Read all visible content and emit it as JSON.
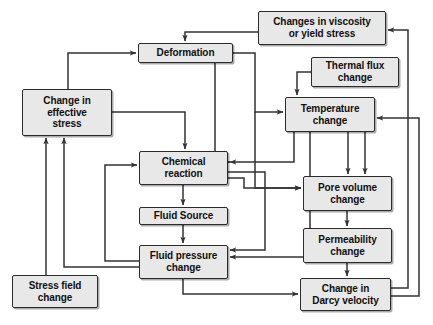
{
  "diagram": {
    "background_color": "#ffffff",
    "node_fill_color": "#e8e8e8",
    "node_border_color": "#2b2b2b",
    "arrow_color": "#333333",
    "nodes": [
      {
        "id": "viscosity",
        "label": "Changes in viscosity or yield stress",
        "line1": "Changes in viscosity",
        "line2": "or yield stress",
        "x": 258,
        "y": 11,
        "w": 128,
        "h": 34
      },
      {
        "id": "deformation",
        "label": "Deformation",
        "line1": "Deformation",
        "line2": "",
        "x": 138,
        "y": 43,
        "w": 95,
        "h": 20
      },
      {
        "id": "thermal-flux",
        "label": "Thermal flux change",
        "line1": "Thermal flux",
        "line2": "change",
        "x": 311,
        "y": 57,
        "w": 88,
        "h": 30
      },
      {
        "id": "effective-stress",
        "label": "Change in effective stress",
        "line1": "Change in",
        "line2": "effective",
        "line3": "stress",
        "x": 22,
        "y": 89,
        "w": 90,
        "h": 47
      },
      {
        "id": "temperature",
        "label": "Temperature change",
        "line1": "Temperature",
        "line2": "change",
        "x": 285,
        "y": 97,
        "w": 90,
        "h": 35
      },
      {
        "id": "chemical-reaction",
        "label": "Chemical reaction",
        "line1": "Chemical",
        "line2": "reaction",
        "x": 139,
        "y": 151,
        "w": 89,
        "h": 34
      },
      {
        "id": "pore-volume",
        "label": "Pore volume change",
        "line1": "Pore volume",
        "line2": "change",
        "x": 303,
        "y": 176,
        "w": 89,
        "h": 35
      },
      {
        "id": "fluid-source",
        "label": "Fluid Source",
        "line1": "Fluid Source",
        "line2": "",
        "x": 139,
        "y": 207,
        "w": 89,
        "h": 18
      },
      {
        "id": "permeability",
        "label": "Permeability change",
        "line1": "Permeability",
        "line2": "change",
        "x": 303,
        "y": 228,
        "w": 89,
        "h": 35
      },
      {
        "id": "fluid-pressure",
        "label": "Fluid pressure change",
        "line1": "Fluid pressure",
        "line2": "change",
        "x": 139,
        "y": 245,
        "w": 89,
        "h": 34
      },
      {
        "id": "stress-field",
        "label": "Stress field change",
        "line1": "Stress field",
        "line2": "change",
        "x": 12,
        "y": 275,
        "w": 86,
        "h": 33
      },
      {
        "id": "darcy-velocity",
        "label": "Change in Darcy velocity",
        "line1": "Change in",
        "line2": "Darcy velocity",
        "x": 300,
        "y": 278,
        "w": 91,
        "h": 33
      }
    ],
    "edges": [
      {
        "from": "viscosity",
        "to": "deformation",
        "name": "viscosity-to-deformation"
      },
      {
        "from": "effective-stress",
        "to": "deformation",
        "name": "effective-stress-to-deformation"
      },
      {
        "from": "effective-stress",
        "to": "chemical-reaction",
        "name": "effective-stress-to-chemical-reaction"
      },
      {
        "from": "deformation",
        "to": "temperature",
        "name": "deformation-to-temperature"
      },
      {
        "from": "deformation",
        "to": "chemical-reaction",
        "name": "deformation-to-chemical-reaction"
      },
      {
        "from": "deformation",
        "to": "pore-volume",
        "name": "deformation-to-pore-volume"
      },
      {
        "from": "thermal-flux",
        "to": "temperature",
        "name": "thermal-flux-to-temperature"
      },
      {
        "from": "temperature",
        "to": "chemical-reaction",
        "name": "temperature-to-chemical-reaction"
      },
      {
        "from": "temperature",
        "to": "pore-volume",
        "name": "temperature-to-pore-volume"
      },
      {
        "from": "temperature",
        "to": "fluid-pressure",
        "name": "temperature-to-fluid-pressure"
      },
      {
        "from": "chemical-reaction",
        "to": "fluid-source",
        "name": "chemical-reaction-to-fluid-source"
      },
      {
        "from": "chemical-reaction",
        "to": "pore-volume",
        "name": "chemical-reaction-to-pore-volume"
      },
      {
        "from": "chemical-reaction",
        "to": "fluid-pressure",
        "name": "chemical-reaction-to-fluid-pressure"
      },
      {
        "from": "fluid-source",
        "to": "fluid-pressure",
        "name": "fluid-source-to-fluid-pressure"
      },
      {
        "from": "fluid-pressure",
        "to": "effective-stress",
        "name": "fluid-pressure-to-effective-stress"
      },
      {
        "from": "fluid-pressure",
        "to": "chemical-reaction",
        "name": "fluid-pressure-to-chemical-reaction"
      },
      {
        "from": "fluid-pressure",
        "to": "darcy-velocity",
        "name": "fluid-pressure-to-darcy-velocity"
      },
      {
        "from": "stress-field",
        "to": "effective-stress",
        "name": "stress-field-to-effective-stress"
      },
      {
        "from": "pore-volume",
        "to": "permeability",
        "name": "pore-volume-to-permeability"
      },
      {
        "from": "permeability",
        "to": "darcy-velocity",
        "name": "permeability-to-darcy-velocity"
      },
      {
        "from": "darcy-velocity",
        "to": "viscosity",
        "name": "darcy-velocity-to-viscosity"
      },
      {
        "from": "darcy-velocity",
        "to": "temperature",
        "name": "darcy-velocity-to-temperature"
      }
    ]
  }
}
